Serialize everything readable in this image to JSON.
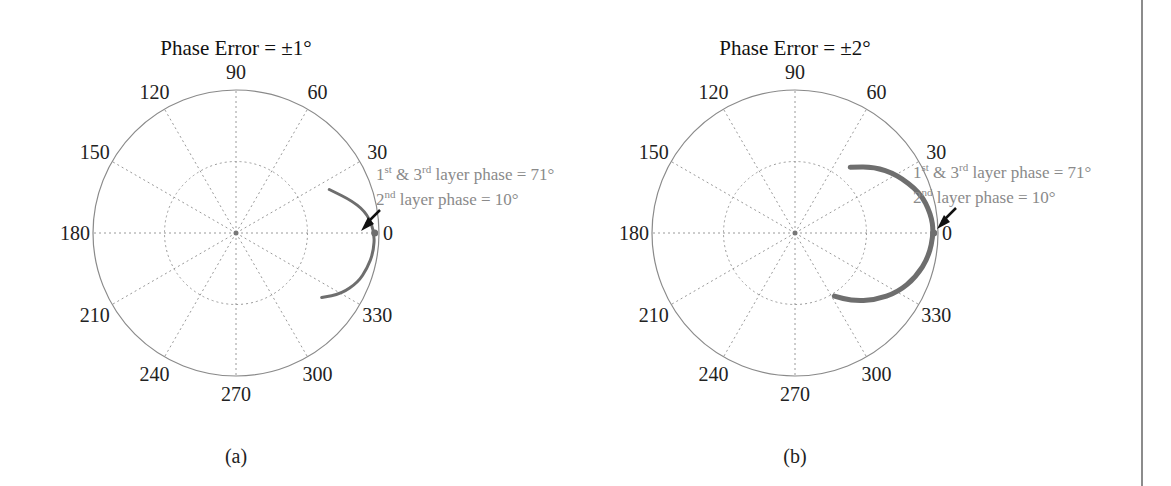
{
  "figure": {
    "panels": [
      {
        "id": "a",
        "title": "Phase Error = ±1°",
        "caption": "(a)",
        "center": [
          236,
          233
        ],
        "radius": 143,
        "annotation_line1": {
          "pre": "1",
          "sup1": "st",
          "mid": " & 3",
          "sup2": "rd",
          "post": " layer phase = 71°"
        },
        "annotation_line2": {
          "pre": "2",
          "sup1": "nd",
          "post": " layer phase = 10°"
        }
      },
      {
        "id": "b",
        "title": "Phase Error = ±2°",
        "caption": "(b)",
        "center": [
          795,
          233
        ],
        "radius": 143,
        "annotation_line1": {
          "pre": "1",
          "sup1": "st",
          "mid": " & 3",
          "sup2": "rd",
          "post": " layer phase = 71°"
        },
        "annotation_line2": {
          "pre": "2",
          "sup1": "nd",
          "post": " layer phase = 10°"
        }
      }
    ],
    "angle_labels": [
      "0",
      "30",
      "60",
      "90",
      "120",
      "150",
      "180",
      "210",
      "240",
      "270",
      "300",
      "330"
    ],
    "colors": {
      "axis_circle": "#8a8a8a",
      "grid": "#9a9a9a",
      "trace": "#6e6e6e",
      "arrow": "#111111",
      "annotation_text": "#8a8a8a",
      "border": "#8c8c8c"
    }
  },
  "chart_data": [
    {
      "type": "scatter",
      "subtype": "polar",
      "title": "Phase Error = ±1°",
      "caption": "(a)",
      "theta_ticks_deg": [
        0,
        30,
        60,
        90,
        120,
        150,
        180,
        210,
        240,
        270,
        300,
        330
      ],
      "radial_grid": [
        0.5,
        1.0
      ],
      "grid": true,
      "series": [
        {
          "name": "array factor variation under ±1° phase error",
          "description": "Narrow arc of points near the unit circle around 0°, spanning roughly +25° to -35°",
          "points_polar_deg_r": [
            [
              25,
              0.72
            ],
            [
              15,
              0.85
            ],
            [
              8,
              0.93
            ],
            [
              0,
              0.97
            ],
            [
              -8,
              0.97
            ],
            [
              -15,
              0.95
            ],
            [
              -22,
              0.92
            ],
            [
              -30,
              0.85
            ],
            [
              -37,
              0.75
            ]
          ]
        }
      ],
      "annotations": [
        "1st & 3rd layer phase = 71°",
        "2nd layer phase = 10°"
      ],
      "arrow_target_deg": 0
    },
    {
      "type": "scatter",
      "subtype": "polar",
      "title": "Phase Error = ±2°",
      "caption": "(b)",
      "theta_ticks_deg": [
        0,
        30,
        60,
        90,
        120,
        150,
        180,
        210,
        240,
        270,
        300,
        330
      ],
      "radial_grid": [
        0.5,
        1.0
      ],
      "grid": true,
      "series": [
        {
          "name": "array factor variation under ±2° phase error",
          "description": "Wider crescent arc spanning roughly +45° through 0° to about -55°",
          "points_polar_deg_r": [
            [
              50,
              0.6
            ],
            [
              40,
              0.72
            ],
            [
              30,
              0.82
            ],
            [
              18,
              0.92
            ],
            [
              8,
              0.96
            ],
            [
              0,
              0.97
            ],
            [
              -10,
              0.95
            ],
            [
              -20,
              0.9
            ],
            [
              -30,
              0.83
            ],
            [
              -40,
              0.73
            ],
            [
              -50,
              0.62
            ],
            [
              -58,
              0.52
            ]
          ]
        }
      ],
      "annotations": [
        "1st & 3rd layer phase = 71°",
        "2nd layer phase = 10°"
      ],
      "arrow_target_deg": 0
    }
  ]
}
